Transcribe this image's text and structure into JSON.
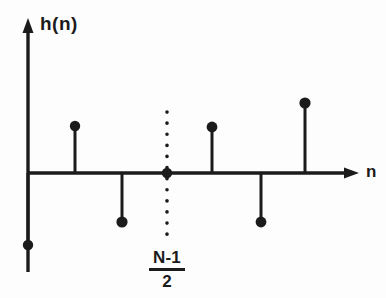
{
  "figure": {
    "title": "",
    "y_axis_label": "h(n)",
    "x_axis_label": "n",
    "midpoint_numerator": "N-1",
    "midpoint_denominator": "2",
    "line_color": "#1b1b1b",
    "background_color": "#fdfdfd"
  },
  "chart_data": {
    "type": "scatter",
    "title": "",
    "xlabel": "n",
    "ylabel": "h(n)",
    "grid": false,
    "legend": null,
    "axis": {
      "x_axis_y_px": 173,
      "y_axis_x_px": 28,
      "x_axis_arrow_x_px": 358,
      "y_axis_arrow_y_px": 20
    },
    "stem_style": {
      "marker": "filled-circle",
      "marker_radius_px": 5,
      "stem_width_px": 3
    },
    "samples": [
      {
        "label": "n0",
        "x_px": 28,
        "tip_y_px": 245,
        "value": -1.55,
        "sign": "negative",
        "on_y_axis": true
      },
      {
        "label": "n1",
        "x_px": 75,
        "tip_y_px": 126,
        "value": 1.0,
        "sign": "positive",
        "on_y_axis": false
      },
      {
        "label": "n2",
        "x_px": 122,
        "tip_y_px": 222,
        "value": -1.05,
        "sign": "negative",
        "on_y_axis": false
      },
      {
        "label": "n3",
        "x_px": 167,
        "tip_y_px": 173,
        "value": 0.0,
        "sign": "zero",
        "on_y_axis": false
      },
      {
        "label": "n4",
        "x_px": 212,
        "tip_y_px": 127,
        "value": 0.98,
        "sign": "positive",
        "on_y_axis": false
      },
      {
        "label": "n5",
        "x_px": 261,
        "tip_y_px": 222,
        "value": -1.05,
        "sign": "negative",
        "on_y_axis": false
      },
      {
        "label": "n6",
        "x_px": 305,
        "tip_y_px": 103,
        "value": 1.5,
        "sign": "positive",
        "on_y_axis": false
      }
    ],
    "center_line": {
      "x_px": 167,
      "y_start_px": 112,
      "y_end_px": 243,
      "style": "dotted",
      "label": "(N-1)/2"
    },
    "ylim": [
      -1.8,
      1.8
    ],
    "xlim": [
      0,
      386
    ]
  }
}
